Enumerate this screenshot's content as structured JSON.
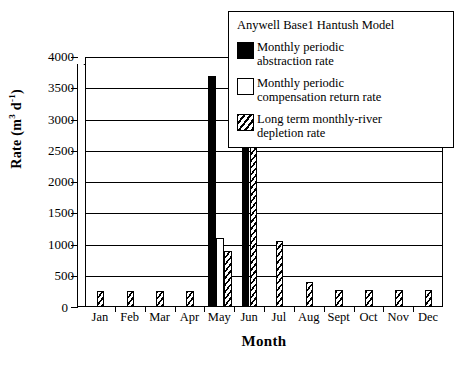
{
  "chart_data": {
    "type": "bar",
    "title": "Anywell Base1 Hantush Model",
    "xlabel": "Month",
    "ylabel": "Rate (m3 d-1)",
    "ylabel_base": "Rate (m",
    "ylabel_sup1": "3",
    "ylabel_mid": " d",
    "ylabel_sup2": "-1",
    "ylabel_close": ")",
    "categories": [
      "Jan",
      "Feb",
      "Mar",
      "Apr",
      "May",
      "Jun",
      "Jul",
      "Aug",
      "Sept",
      "Oct",
      "Nov",
      "Dec"
    ],
    "ylim": [
      0,
      4000
    ],
    "yticks": [
      0,
      500,
      1000,
      1500,
      2000,
      2500,
      3000,
      3500,
      4000
    ],
    "ytick_labels": [
      "0",
      "500",
      "1000",
      "1500",
      "2000",
      "2500",
      "3000",
      "3500",
      "4000"
    ],
    "grid": true,
    "legend_position": "inside-top-right",
    "series": [
      {
        "name": "Monthly periodic abstraction rate",
        "name_line1": "Monthly periodic",
        "name_line2": "abstraction rate",
        "style": "solid-black",
        "color": "#000000",
        "values": [
          0,
          0,
          0,
          0,
          3700,
          3700,
          0,
          0,
          0,
          0,
          0,
          0
        ]
      },
      {
        "name": "Monthly periodic compensation return rate",
        "name_line1": "Monthly periodic",
        "name_line2": "compensation return rate",
        "style": "open-white",
        "color": "#ffffff",
        "values": [
          0,
          0,
          0,
          0,
          1100,
          0,
          0,
          0,
          0,
          0,
          0,
          0
        ]
      },
      {
        "name": "Long term monthly-river depletion rate",
        "name_line1": "Long term monthly-river",
        "name_line2": "depletion rate",
        "style": "hatched-diagonal",
        "color": "#000000",
        "values": [
          250,
          250,
          250,
          250,
          900,
          2600,
          1050,
          400,
          280,
          280,
          280,
          280
        ]
      }
    ]
  }
}
